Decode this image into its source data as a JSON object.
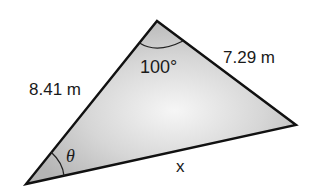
{
  "diagram": {
    "type": "triangle",
    "fill_color_center": "#f4f4f4",
    "fill_color_edge": "#b9b9b9",
    "stroke_color": "#111111",
    "vertices": {
      "top": [
        157,
        21
      ],
      "bottom_left": [
        26,
        184
      ],
      "right": [
        296,
        125
      ]
    },
    "labels": {
      "left_side": "8.41 m",
      "right_side": "7.29 m",
      "top_angle": "100°",
      "bottom_side": "x",
      "left_angle": "θ"
    }
  }
}
